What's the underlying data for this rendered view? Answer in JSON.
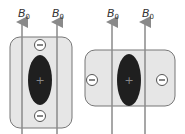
{
  "labels": {
    "field": "B",
    "field_sub": "0",
    "plus": "+",
    "minus": "−"
  },
  "colors": {
    "box_fill": "#e6e6e6",
    "box_stroke": "#777777",
    "line": "#8a8a8a",
    "ellipse": "#1f1f1f"
  },
  "panels": [
    {
      "name": "vertical-orientation",
      "minus_positions": [
        "top",
        "bottom"
      ]
    },
    {
      "name": "horizontal-orientation",
      "minus_positions": [
        "left",
        "right"
      ]
    }
  ]
}
